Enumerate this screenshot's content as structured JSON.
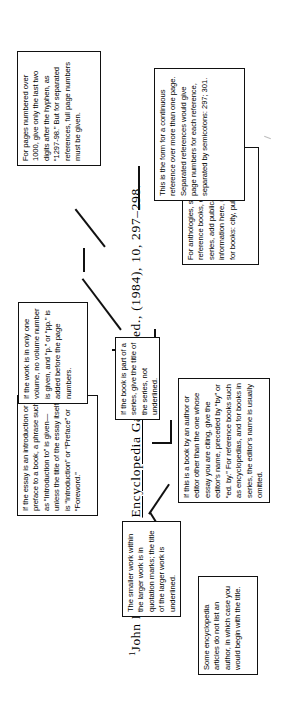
{
  "document": {
    "title": "Footnote citation anatomy diagram",
    "orientation": "rotated-90-counterclockwise",
    "page_background": "#ffffff",
    "ink_color": "#111111"
  },
  "citation": {
    "superscript": "1",
    "author": "John Doe,",
    "article_title": "\"Mirages,\"",
    "source_title": "Encyclopedia Galactica,",
    "edition": "2nd. ed.,",
    "year": "(1984),",
    "volume": "10,",
    "pages": "297–298.",
    "full_text": "1John Doe, \"Mirages,\" Encyclopedia Galactica, 2nd. ed., (1984), 10, 297–298."
  },
  "callouts": [
    {
      "id": "no-author",
      "text": "Some encyclopedia articles do not list an author, in which case you would begin with the title."
    },
    {
      "id": "quotation-marks-and-underlining",
      "text": "The smaller work within the larger work is in quotation marks; the title of the larger work is underlined."
    },
    {
      "id": "editor-name",
      "text": "If this is a book by an author or editor other than the one whose essay you are citing, give the editor's name, preceded by “by” or “ed. by.” For reference books such as encyclopedias, and for books in series, the editor's name is usually omitted."
    },
    {
      "id": "publication-information",
      "text": "For anthologies, specialized reference books, or books in a series, add publication information here, using the form for books: city, publisher, date."
    },
    {
      "id": "continuous-reference",
      "text": "This is the form for a continuous reference over more than one page. Separated references would give page numbers for each reference, separated by semicolons: 297; 301."
    },
    {
      "id": "pages-over-1000",
      "text": "For pages numbered over 1000, give only the last two digits after the hyphen, as “1297-98.” But for separated references, full page numbers must be given."
    },
    {
      "id": "introduction-or-preface",
      "text": "If the essay is an introduction or preface to a book, a phrase such as “Introduction to” is given—unless the title of the essay itself is “Introduction” or “Preface” or “Foreword.”"
    },
    {
      "id": "book-in-series",
      "text": "If the book is part of a series, give the title of the series, not underlined."
    },
    {
      "id": "single-volume",
      "text": "If the work is in only one volume, no volume number is given, and “p.” or “pp.” is added before the page numbers."
    }
  ]
}
